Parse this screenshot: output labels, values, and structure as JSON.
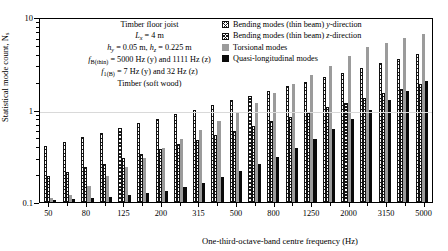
{
  "chart_data": {
    "type": "bar",
    "title": "",
    "xlabel": "One-third-octave-band centre frequency (Hz)",
    "ylabel": "Statistical mode count, N",
    "ylabel_sub": "s",
    "ylim": [
      0.1,
      10
    ],
    "yscale": "log",
    "ytick_labels": [
      "10",
      "1",
      "0.1"
    ],
    "ytick_values": [
      10,
      1,
      0.1
    ],
    "grid": true,
    "legend_position": "top-right",
    "categories": [
      50,
      63,
      80,
      100,
      125,
      160,
      200,
      250,
      315,
      400,
      500,
      630,
      800,
      1000,
      1250,
      1600,
      2000,
      2500,
      3150,
      4000,
      5000
    ],
    "xtick_labels": [
      "50",
      "80",
      "125",
      "200",
      "315",
      "500",
      "800",
      "1250",
      "2000",
      "3150",
      "5000"
    ],
    "series": [
      {
        "name": "Bending modes (thin beam) y-direction",
        "key": "bending_y",
        "style": "hatch-y",
        "values": [
          0.4,
          0.44,
          0.5,
          0.56,
          0.63,
          0.71,
          0.79,
          0.89,
          1.0,
          1.12,
          1.26,
          1.41,
          1.58,
          1.78,
          2.0,
          2.24,
          2.51,
          2.82,
          3.16,
          3.55,
          3.98
        ]
      },
      {
        "name": "Bending modes (thin beam) z-direction",
        "key": "bending_z",
        "style": "hatch-z",
        "values": [
          0.19,
          0.21,
          0.24,
          0.26,
          0.3,
          0.33,
          0.37,
          0.42,
          0.47,
          0.53,
          0.59,
          0.67,
          0.75,
          0.84,
          0.94,
          1.06,
          1.19,
          1.33,
          1.5,
          1.68,
          1.88
        ]
      },
      {
        "name": "Torsional modes",
        "key": "torsional",
        "style": "solid-gray",
        "values": [
          0.11,
          0.12,
          0.15,
          0.19,
          0.24,
          0.3,
          0.38,
          0.48,
          0.6,
          0.75,
          0.95,
          1.19,
          1.5,
          1.88,
          2.37,
          2.98,
          3.75,
          4.72,
          5.2,
          5.9,
          6.6
        ]
      },
      {
        "name": "Quasi-longitudinal modes",
        "key": "quasi_longitudinal",
        "style": "solid-black",
        "values": [
          0.105,
          0.107,
          0.11,
          0.113,
          0.118,
          0.124,
          0.133,
          0.145,
          0.162,
          0.185,
          0.215,
          0.255,
          0.31,
          0.385,
          0.48,
          0.61,
          0.78,
          1.0,
          1.28,
          1.6,
          2.05
        ]
      }
    ]
  },
  "annotation": {
    "line1": "Timber floor joist",
    "line2_sym": "L",
    "line2_sub": "x",
    "line2_val": " = 4 m",
    "line3_sym1": "h",
    "line3_sub1": "y",
    "line3_val1": " = 0.05 m, ",
    "line3_sym2": "h",
    "line3_sub2": "z",
    "line3_val2": " = 0.225 m",
    "line4_sym": "f",
    "line4_sub": "B(thin)",
    "line4_val": " = 5000 Hz (y) and 1111 Hz (z)",
    "line5_sym": "f",
    "line5_sub": "1(B)",
    "line5_val": " = 7 Hz (y) and 32 Hz (z)",
    "line6": "Timber (soft wood)"
  },
  "legend": {
    "items": [
      {
        "label": "Bending modes (thin beam) y-direction",
        "swatch": "hatch-y"
      },
      {
        "label": "Bending modes (thin beam) z-direction",
        "swatch": "hatch-z"
      },
      {
        "label": "Torsional modes",
        "swatch": "solid-gray"
      },
      {
        "label": "Quasi-longitudinal modes",
        "swatch": "solid-black"
      }
    ]
  },
  "colors": {
    "torsional": "#9b9b9b",
    "quasi_longitudinal": "#0a0a0a",
    "axis": "#000000",
    "grid": "#d9d9d9"
  }
}
